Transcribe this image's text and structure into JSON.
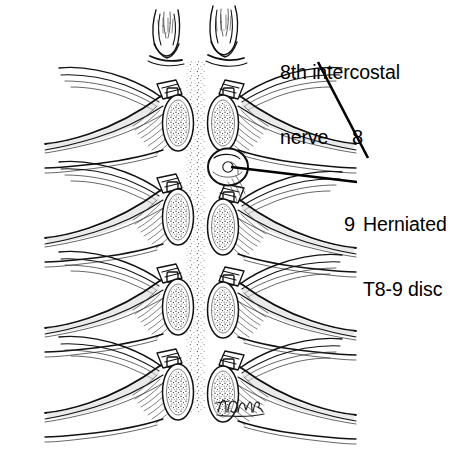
{
  "figure": {
    "kind": "medical-line-illustration",
    "background_color": "#ffffff",
    "ink_color": "#111111",
    "view": "posterior / axial cut-away of thoracic vertebral levels",
    "columns": 2,
    "segments_per_column": 4
  },
  "labels": {
    "nerve": "8th intercostal\nnerve",
    "nerve_line1": "8th intercostal",
    "nerve_line2": "nerve",
    "herniated": "Herniated\nT8-9 disc",
    "herniated_line1": "Herniated",
    "herniated_line2": "T8-9 disc",
    "level_8": "8",
    "level_9": "9"
  },
  "leaders": [
    {
      "name": "nerve-leader",
      "from_label": "8th intercostal nerve",
      "x1": 318,
      "y1": 62,
      "x2": 368,
      "y2": 158
    },
    {
      "name": "hernia-leader",
      "from_label": "Herniated T8-9 disc",
      "x1": 357,
      "y1": 182,
      "x2": 231,
      "y2": 167
    }
  ],
  "annotated_structures": [
    {
      "name": "8th intercostal nerve",
      "marker": "8",
      "side": "right",
      "level_index": 1
    },
    {
      "name": "Herniated T8-9 disc",
      "marker": "9",
      "side": "right",
      "level_index": 2
    }
  ],
  "signature": {
    "text": "TDMR",
    "x": 218,
    "y": 404,
    "style": "cursive artist monogram"
  },
  "palette": {
    "background": "#ffffff",
    "ink": "#111111",
    "hatch": "#333333",
    "stipple": "#1a1a1a",
    "shade": "#d9d9d9"
  }
}
